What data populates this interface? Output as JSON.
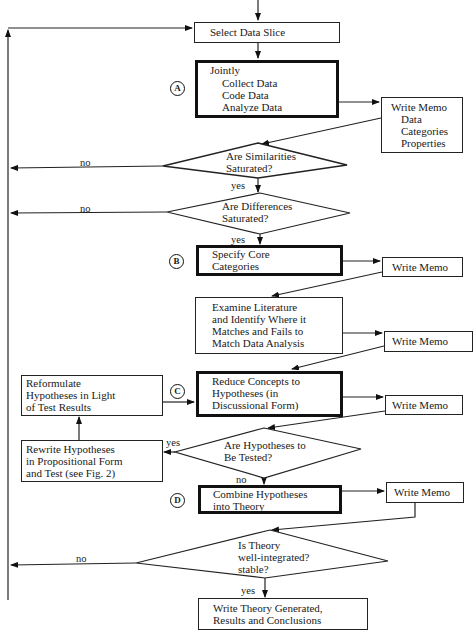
{
  "diagram": {
    "type": "flowchart",
    "nodes": {
      "select_slice": {
        "label": "Select Data Slice"
      },
      "jointly": {
        "lines": [
          "Jointly",
          "Collect Data",
          "Code Data",
          "Analyze Data"
        ],
        "marker": "A"
      },
      "memo1": {
        "lines": [
          "Write Memo",
          "Data",
          "Categories",
          "Properties"
        ]
      },
      "similarities": {
        "lines": [
          "Are Similarities",
          "Saturated?"
        ]
      },
      "differences": {
        "lines": [
          "Are Differences",
          "Saturated?"
        ]
      },
      "core": {
        "lines": [
          "Specify Core",
          "Categories"
        ],
        "marker": "B"
      },
      "memo2": {
        "label": "Write Memo"
      },
      "literature": {
        "lines": [
          "Examine Literature",
          "and Identify Where it",
          "Matches and Fails to",
          "Match Data Analysis"
        ]
      },
      "memo3": {
        "label": "Write Memo"
      },
      "reduce": {
        "lines": [
          "Reduce Concepts to",
          "Hypotheses (in",
          "Discussional Form)"
        ],
        "marker": "C"
      },
      "memo4": {
        "label": "Write Memo"
      },
      "reformulate": {
        "lines": [
          "Reformulate",
          "Hypotheses in Light",
          "of Test Results"
        ]
      },
      "tested": {
        "lines": [
          "Are Hypotheses to",
          "Be Tested?"
        ]
      },
      "rewrite": {
        "lines": [
          "Rewrite Hypotheses",
          "in Propositional Form",
          "and Test (see Fig. 2)"
        ]
      },
      "combine": {
        "lines": [
          "Combine Hypotheses",
          "into Theory"
        ],
        "marker": "D"
      },
      "memo5": {
        "label": "Write Memo"
      },
      "integrated": {
        "lines": [
          "Is Theory",
          "well-integrated?",
          "stable?"
        ]
      },
      "final": {
        "lines": [
          "Write Theory Generated,",
          "Results and Conclusions"
        ]
      }
    },
    "edge_labels": {
      "sim_no": "no",
      "sim_yes": "yes",
      "diff_no": "no",
      "diff_yes": "yes",
      "tested_yes": "yes",
      "tested_no": "no",
      "integrated_no": "no",
      "integrated_yes": "yes"
    }
  }
}
